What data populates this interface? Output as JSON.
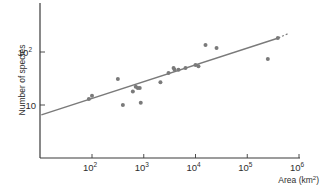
{
  "chart_data": {
    "type": "scatter",
    "title": "",
    "xlabel": "Area (km²)",
    "ylabel": "Number of species",
    "x_scale": "log",
    "y_scale": "log",
    "xlim": [
      10,
      1000000
    ],
    "ylim": [
      2,
      320
    ],
    "grid": false,
    "legend": null,
    "x_ticks": [
      {
        "value": 100,
        "base": "10",
        "exp": "2"
      },
      {
        "value": 1000,
        "base": "10",
        "exp": "3"
      },
      {
        "value": 10000,
        "base": "10",
        "exp": "4"
      },
      {
        "value": 100000,
        "base": "10",
        "exp": "5"
      },
      {
        "value": 1000000,
        "base": "10",
        "exp": "6"
      }
    ],
    "y_ticks": [
      {
        "value": 10,
        "base": "10",
        "exp": ""
      },
      {
        "value": 100,
        "base": "10",
        "exp": "2"
      }
    ],
    "series": [
      {
        "name": "Islands",
        "marker": "circle",
        "color": "#7a7a7a",
        "points": [
          {
            "x": 87,
            "y": 13
          },
          {
            "x": 100,
            "y": 15
          },
          {
            "x": 316,
            "y": 31
          },
          {
            "x": 395,
            "y": 10
          },
          {
            "x": 615,
            "y": 18
          },
          {
            "x": 700,
            "y": 22
          },
          {
            "x": 765,
            "y": 21
          },
          {
            "x": 836,
            "y": 21
          },
          {
            "x": 875,
            "y": 11
          },
          {
            "x": 2100,
            "y": 27
          },
          {
            "x": 3010,
            "y": 40
          },
          {
            "x": 3770,
            "y": 50
          },
          {
            "x": 3945,
            "y": 46
          },
          {
            "x": 4700,
            "y": 46
          },
          {
            "x": 6400,
            "y": 50
          },
          {
            "x": 10000,
            "y": 57
          },
          {
            "x": 11400,
            "y": 54
          },
          {
            "x": 15600,
            "y": 135
          },
          {
            "x": 25500,
            "y": 119
          },
          {
            "x": 250000,
            "y": 74
          },
          {
            "x": 390000,
            "y": 184
          }
        ]
      }
    ],
    "fit_line": {
      "name": "Regression line",
      "color": "#7a7a7a",
      "start": {
        "x": 10.5,
        "y": 6.5
      },
      "end": {
        "x": 400000,
        "y": 184
      },
      "dashed_extension_end": {
        "x": 600000,
        "y": 220
      }
    }
  },
  "axes": {
    "color": "#3a3a3a"
  }
}
